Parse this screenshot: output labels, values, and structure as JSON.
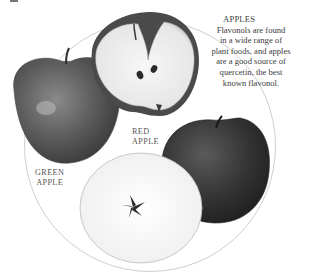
{
  "caption": {
    "title": "APPLES",
    "lines": [
      "Flavonols are found",
      "in a wide range of",
      "plant foods, and apples",
      "are a good source of",
      "quercetin, the best",
      "known flavonol."
    ]
  },
  "labels": {
    "red_apple": [
      "RED",
      "APPLE"
    ],
    "green_apple": [
      "GREEN",
      "APPLE"
    ]
  },
  "illustrations": [
    {
      "name": "whole-green-apple",
      "description": "Whole apple with stem, left"
    },
    {
      "name": "halved-apple",
      "description": "Apple cut in half showing seeds, top"
    },
    {
      "name": "whole-red-apple",
      "description": "Dark whole apple, right"
    },
    {
      "name": "apple-cross-section",
      "description": "Horizontal apple slice showing star-shaped core, bottom"
    }
  ],
  "colors": {
    "ring": "#cfcfcf",
    "text": "#3c3c3c"
  }
}
